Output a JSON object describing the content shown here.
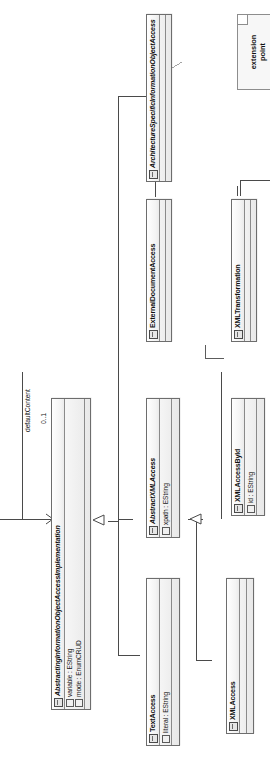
{
  "diagram": {
    "kind": "uml-class-diagram",
    "title": "ArchitectureSpecificInformationObjectAccess",
    "orientation": "rotated-90-ccw",
    "colors": {
      "line": "#6d6d6d",
      "fill_light": "#fdfdfd",
      "fill_dark": "#e8e8e8",
      "note_fill": "#f7f7f7",
      "text": "#111111"
    },
    "classes": [
      {
        "id": "asioa",
        "name": "ArchitectureSpecificInformationObjectAccess",
        "abstract": true,
        "icon": "class-icon",
        "attributes": [],
        "compartments": 2
      },
      {
        "id": "eda",
        "name": "ExternalDocumentAccess",
        "abstract": false,
        "icon": "class-icon",
        "attributes": [],
        "compartments": 2
      },
      {
        "id": "xmltrans",
        "name": "XMLTransformation",
        "abstract": false,
        "icon": "class-icon",
        "attributes": [],
        "compartments": 2
      },
      {
        "id": "asioai",
        "name": "AbstractingInformationObjectAccessImplementation",
        "abstract": true,
        "icon": "class-icon",
        "attributes": [
          {
            "text": "variable : EString",
            "icon": "attribute-icon"
          },
          {
            "text": "mode : EnumCRUD",
            "icon": "attribute-icon"
          }
        ],
        "compartments": 2
      },
      {
        "id": "absxml",
        "name": "AbstractXMLAccess",
        "abstract": true,
        "icon": "class-icon",
        "attributes": [
          {
            "text": "xpath : EString",
            "icon": "attribute-icon"
          }
        ],
        "compartments": 2
      },
      {
        "id": "xmlbyid",
        "name": "XMLAccessById",
        "abstract": false,
        "icon": "class-icon",
        "attributes": [
          {
            "text": "id : EString",
            "icon": "attribute-icon"
          }
        ],
        "compartments": 2
      },
      {
        "id": "textacc",
        "name": "TextAccess",
        "abstract": false,
        "icon": "class-icon",
        "attributes": [
          {
            "text": "literal : EString",
            "icon": "attribute-icon"
          }
        ],
        "compartments": 2
      },
      {
        "id": "xmlacc",
        "name": "XMLAccess",
        "abstract": false,
        "icon": "class-icon",
        "attributes": [],
        "compartments": 2
      }
    ],
    "notes": [
      {
        "id": "note-extension-point",
        "lines": [
          "extension",
          "point"
        ],
        "attached_to": "asioa"
      }
    ],
    "association_labels": [
      {
        "id": "label-default-content",
        "text": "defaultContent"
      },
      {
        "id": "label-multiplicity-0-1",
        "text": "0..1"
      }
    ],
    "relationships": [
      {
        "type": "generalization",
        "source": "asioai",
        "target": "asioa"
      },
      {
        "type": "generalization",
        "source": "eda",
        "target": "asioa"
      },
      {
        "type": "generalization",
        "source": "absxml",
        "target": "asioai"
      },
      {
        "type": "generalization",
        "source": "textacc",
        "target": "asioai"
      },
      {
        "type": "generalization",
        "source": "xmlbyid",
        "target": "absxml"
      },
      {
        "type": "generalization",
        "source": "xmlacc",
        "target": "absxml"
      },
      {
        "type": "association",
        "source": "asioai",
        "target": "asioa",
        "label": "defaultContent",
        "multiplicity": "0..1"
      }
    ]
  }
}
